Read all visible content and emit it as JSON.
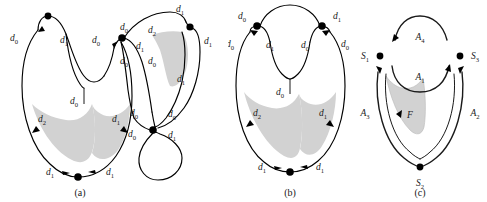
{
  "figure": {
    "background_color": "#ffffff",
    "stroke_color": "#000000",
    "shade_color": "#d2d2d2",
    "panels": [
      {
        "id": "a",
        "caption": "(a)",
        "labels": [
          "d_0",
          "d_1",
          "d_0",
          "d_0",
          "d_0",
          "d_1",
          "d_2",
          "d_1",
          "d_1",
          "d_0",
          "d_0",
          "d_1",
          "d_0",
          "d_0",
          "d_0",
          "d_1",
          "d_2",
          "d_1",
          "d_1",
          "d_1"
        ]
      },
      {
        "id": "b",
        "caption": "(b)",
        "labels": [
          "d_0",
          "d_1",
          "d_0",
          "d_1",
          "d_0",
          "d_0",
          "d_0",
          "d_2",
          "d_1",
          "d_1",
          "d_1"
        ]
      },
      {
        "id": "c",
        "caption": "(c)",
        "labels": [
          "S_1",
          "S_3",
          "S_2",
          "A_1",
          "A_2",
          "A_3",
          "A_4",
          "F"
        ]
      }
    ]
  },
  "panel_a": {
    "caption": "(a)",
    "label_left_outer": {
      "base": "d",
      "sub": "0"
    },
    "label_left_inner": {
      "base": "d",
      "sub": "1"
    },
    "label_mid_left": {
      "base": "d",
      "sub": "0"
    },
    "label_mid_right": {
      "base": "d",
      "sub": "0"
    },
    "label_node2_upleft": {
      "base": "d",
      "sub": "0"
    },
    "label_node2_right": {
      "base": "d",
      "sub": "1"
    },
    "label_node2_downright": {
      "base": "d",
      "sub": "0"
    },
    "label_top_d2": {
      "base": "d",
      "sub": "2"
    },
    "label_top_d1": {
      "base": "d",
      "sub": "1"
    },
    "label_right_d1": {
      "base": "d",
      "sub": "1"
    },
    "label_right_inner_d1": {
      "base": "d",
      "sub": "1"
    },
    "label_center_d0": {
      "base": "d",
      "sub": "0"
    },
    "label_lowleft_d2": {
      "base": "d",
      "sub": "2"
    },
    "label_lowright_d1": {
      "base": "d",
      "sub": "1"
    },
    "label_bottom_left_d1": {
      "base": "d",
      "sub": "1"
    },
    "label_bottom_right_d1": {
      "base": "d",
      "sub": "1"
    },
    "label_loop_upleft_d0": {
      "base": "d",
      "sub": "0"
    },
    "label_loop_upright_d0": {
      "base": "d",
      "sub": "0"
    },
    "label_loop_downleft_d0": {
      "base": "d",
      "sub": "0"
    },
    "label_loop_downright_d1": {
      "base": "d",
      "sub": "1"
    }
  },
  "panel_b": {
    "caption": "(b)",
    "label_top_left_d0": {
      "base": "d",
      "sub": "0"
    },
    "label_top_right_d1": {
      "base": "d",
      "sub": "1"
    },
    "label_left_outer_d0": {
      "base": "d",
      "sub": "0"
    },
    "label_left_inner_d1": {
      "base": "d",
      "sub": "1"
    },
    "label_right_inner_d0": {
      "base": "d",
      "sub": "0"
    },
    "label_right_outer_d0": {
      "base": "d",
      "sub": "0"
    },
    "label_center_d0": {
      "base": "d",
      "sub": "0"
    },
    "label_lowleft_d2": {
      "base": "d",
      "sub": "2"
    },
    "label_lowright_d1": {
      "base": "d",
      "sub": "1"
    },
    "label_bottom_left_d1": {
      "base": "d",
      "sub": "1"
    },
    "label_bottom_right_d1": {
      "base": "d",
      "sub": "1"
    }
  },
  "panel_c": {
    "caption": "(c)",
    "label_s1": {
      "base": "S",
      "sub": "1"
    },
    "label_s2": {
      "base": "S",
      "sub": "2"
    },
    "label_s3": {
      "base": "S",
      "sub": "3"
    },
    "label_a1": {
      "base": "A",
      "sub": "1"
    },
    "label_a2": {
      "base": "A",
      "sub": "2"
    },
    "label_a3": {
      "base": "A",
      "sub": "3"
    },
    "label_a4": {
      "base": "A",
      "sub": "4"
    },
    "label_f": {
      "base": "F",
      "sub": ""
    }
  }
}
